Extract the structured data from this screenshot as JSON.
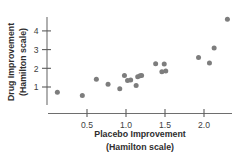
{
  "chart_data": {
    "type": "scatter",
    "title": "",
    "xlabel": "Placebo Improvement (Hamilton scale)",
    "ylabel": "Drug Improvement (Hamilton scale)",
    "xlabel_line1": "Placebo Improvement",
    "xlabel_line2": "(Hamilton scale)",
    "ylabel_line1": "Drug Improvement",
    "ylabel_line2": "(Hamilton scale)",
    "xlim": [
      0.05,
      2.4
    ],
    "ylim": [
      0.35,
      4.9
    ],
    "xticks": [
      0.5,
      1.0,
      1.5,
      2.0
    ],
    "xtick_labels": [
      "0.5",
      "1.0",
      "1.5",
      "2.0"
    ],
    "yticks": [
      1,
      2,
      3,
      4
    ],
    "ytick_labels": [
      "1",
      "2",
      "3",
      "4"
    ],
    "grid": false,
    "legend": false,
    "marker_color": "#7d7d7d",
    "axis_color": "#6e6e6e",
    "points": [
      {
        "x": 0.12,
        "y": 0.72
      },
      {
        "x": 0.44,
        "y": 0.55
      },
      {
        "x": 0.62,
        "y": 1.42
      },
      {
        "x": 0.77,
        "y": 1.15
      },
      {
        "x": 0.92,
        "y": 0.9
      },
      {
        "x": 0.98,
        "y": 1.62
      },
      {
        "x": 1.02,
        "y": 1.35
      },
      {
        "x": 1.06,
        "y": 1.38
      },
      {
        "x": 1.13,
        "y": 1.08
      },
      {
        "x": 1.15,
        "y": 1.55
      },
      {
        "x": 1.18,
        "y": 1.6
      },
      {
        "x": 1.2,
        "y": 1.62
      },
      {
        "x": 1.38,
        "y": 2.25
      },
      {
        "x": 1.46,
        "y": 1.82
      },
      {
        "x": 1.49,
        "y": 2.23
      },
      {
        "x": 1.51,
        "y": 1.85
      },
      {
        "x": 1.93,
        "y": 2.58
      },
      {
        "x": 2.07,
        "y": 2.28
      },
      {
        "x": 2.13,
        "y": 3.08
      },
      {
        "x": 2.3,
        "y": 4.62
      }
    ]
  }
}
